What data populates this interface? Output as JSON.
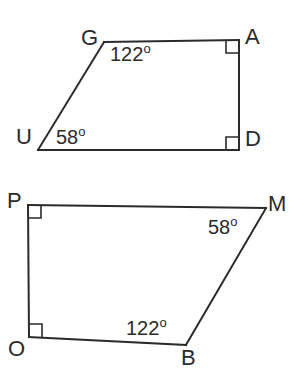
{
  "figures": [
    {
      "name": "quadrilateral-guad",
      "vertices": [
        {
          "id": "G",
          "label": "G",
          "x": 104,
          "y": 42,
          "label_x": 81,
          "label_y": 27
        },
        {
          "id": "A",
          "label": "A",
          "x": 239,
          "y": 40,
          "label_x": 245,
          "label_y": 26
        },
        {
          "id": "D",
          "label": "D",
          "x": 239,
          "y": 150,
          "label_x": 245,
          "label_y": 128
        },
        {
          "id": "U",
          "label": "U",
          "x": 38,
          "y": 150,
          "label_x": 16,
          "label_y": 126
        }
      ],
      "edges": [
        {
          "from": "G",
          "to": "A"
        },
        {
          "from": "A",
          "to": "D"
        },
        {
          "from": "D",
          "to": "U"
        },
        {
          "from": "U",
          "to": "G"
        }
      ],
      "angles": [
        {
          "at": "G",
          "value": "122",
          "degree": "o",
          "label_x": 110,
          "label_y": 42
        },
        {
          "at": "U",
          "value": "58",
          "degree": "o",
          "label_x": 56,
          "label_y": 125
        }
      ],
      "right_angles": [
        {
          "at": "A",
          "x": 239,
          "y": 40,
          "dx": -1,
          "dy": 1
        },
        {
          "at": "D",
          "x": 239,
          "y": 150,
          "dx": -1,
          "dy": -1
        }
      ]
    },
    {
      "name": "quadrilateral-pmbo",
      "vertices": [
        {
          "id": "P",
          "label": "P",
          "x": 28,
          "y": 205,
          "label_x": 7,
          "label_y": 190
        },
        {
          "id": "M",
          "label": "M",
          "x": 266,
          "y": 208,
          "label_x": 268,
          "label_y": 193
        },
        {
          "id": "B",
          "label": "B",
          "x": 186,
          "y": 345,
          "label_x": 181,
          "label_y": 347
        },
        {
          "id": "O",
          "label": "O",
          "x": 29,
          "y": 337,
          "label_x": 8,
          "label_y": 338
        }
      ],
      "edges": [
        {
          "from": "P",
          "to": "M"
        },
        {
          "from": "M",
          "to": "B"
        },
        {
          "from": "B",
          "to": "O"
        },
        {
          "from": "O",
          "to": "P"
        }
      ],
      "angles": [
        {
          "at": "M",
          "value": "58",
          "degree": "o",
          "label_x": 208,
          "label_y": 215
        },
        {
          "at": "B",
          "value": "122",
          "degree": "o",
          "label_x": 126,
          "label_y": 316
        }
      ],
      "right_angles": [
        {
          "at": "P",
          "x": 28,
          "y": 205,
          "dx": 1,
          "dy": 1
        },
        {
          "at": "O",
          "x": 29,
          "y": 337,
          "dx": 1,
          "dy": -1
        }
      ]
    }
  ],
  "style": {
    "stroke_color": "#2b2b2b",
    "stroke_width": 2,
    "right_angle_size": 13,
    "background": "#ffffff"
  }
}
